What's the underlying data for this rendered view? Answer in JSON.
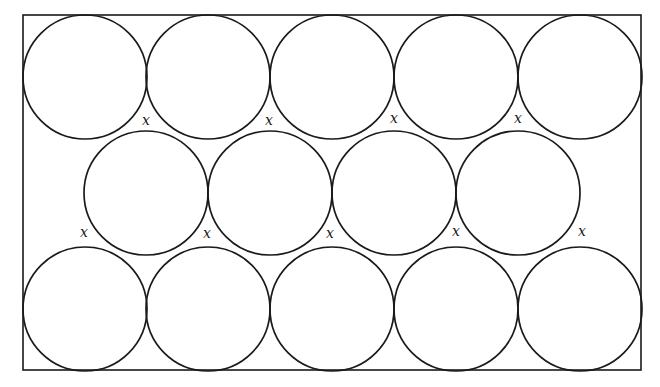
{
  "diagram": {
    "frame": {
      "x": 23,
      "y": 15,
      "width": 618,
      "height": 355
    },
    "circle_radius": 62,
    "rows": [
      {
        "name": "top",
        "cy": 77,
        "cx": [
          85,
          208,
          332,
          456,
          580
        ]
      },
      {
        "name": "middle",
        "cy": 193,
        "cx": [
          146,
          270,
          394,
          518
        ]
      },
      {
        "name": "bottom",
        "cy": 309,
        "cx": [
          85,
          208,
          332,
          456,
          580
        ]
      }
    ],
    "gap_labels": [
      {
        "text": "x",
        "x": 146,
        "y": 125
      },
      {
        "text": "x",
        "x": 269,
        "y": 125
      },
      {
        "text": "x",
        "x": 394,
        "y": 123
      },
      {
        "text": "x",
        "x": 518,
        "y": 123
      },
      {
        "text": "x",
        "x": 84,
        "y": 237
      },
      {
        "text": "x",
        "x": 207,
        "y": 238
      },
      {
        "text": "x",
        "x": 330,
        "y": 238
      },
      {
        "text": "x",
        "x": 456,
        "y": 236
      },
      {
        "text": "x",
        "x": 582,
        "y": 236
      }
    ]
  }
}
